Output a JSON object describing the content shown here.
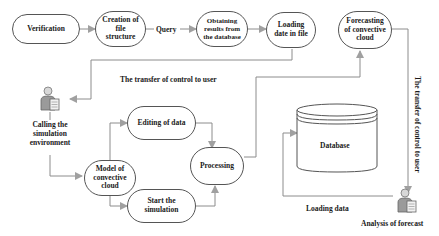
{
  "diagram": {
    "nodes": {
      "verification": "Verification",
      "creation_file_structure": "Creation of file structure",
      "obtaining_results": "Obtaining results from the database",
      "loading_date": "Loading date in file",
      "forecasting": "Forecasting of convective cloud",
      "editing_data": "Editing of data",
      "model_convective": "Model of convective cloud",
      "processing": "Processing",
      "start_simulation": "Start the simulation",
      "database": "Database"
    },
    "labels": {
      "query": "Query",
      "transfer_control_horizontal": "The transfer of control to user",
      "transfer_control_vertical": "The transfer of control to user",
      "calling_simulation": "Calling the simulation environment",
      "loading_data": "Loading data",
      "analysis_forecast": "Analysis of forecast"
    },
    "icons": {
      "user_left": "user-with-document-icon",
      "user_right": "user-with-document-icon"
    },
    "colors": {
      "line": "#8c8c8c",
      "border": "#555555",
      "arrow": "#a0a0a0"
    }
  }
}
